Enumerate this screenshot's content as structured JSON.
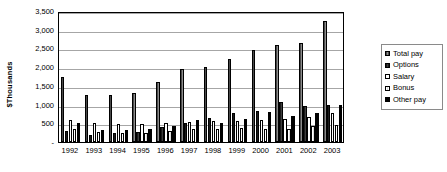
{
  "chart_data": {
    "type": "bar",
    "title": "",
    "xlabel": "",
    "ylabel": "$Thousands",
    "ylim": [
      0,
      3500
    ],
    "ytick_values": [
      0,
      500,
      1000,
      1500,
      2000,
      2500,
      3000,
      3500
    ],
    "ytick_labels": [
      "-",
      "500",
      "1,000",
      "1,500",
      "2,000",
      "2,500",
      "3,000",
      "3,500"
    ],
    "grid": true,
    "legend_position": "right",
    "categories": [
      "1992",
      "1993",
      "1994",
      "1995",
      "1996",
      "1997",
      "1998",
      "1999",
      "2000",
      "2001",
      "2002",
      "2003"
    ],
    "series": [
      {
        "name": "Total pay",
        "color": "#6e6e6e",
        "values": [
          1740,
          1260,
          1260,
          1320,
          1610,
          1950,
          2000,
          2220,
          2470,
          2590,
          2650,
          3220
        ]
      },
      {
        "name": "Options",
        "color": "#2b2b2b",
        "values": [
          290,
          190,
          240,
          260,
          390,
          520,
          650,
          780,
          830,
          1060,
          950,
          1000
        ]
      },
      {
        "name": "Salary",
        "color": "#ffffff",
        "values": [
          590,
          500,
          470,
          480,
          510,
          540,
          560,
          570,
          580,
          610,
          660,
          770
        ]
      },
      {
        "name": "Bonus",
        "color": "#eeeeee",
        "values": [
          340,
          260,
          240,
          250,
          300,
          360,
          360,
          370,
          360,
          340,
          420,
          460
        ]
      },
      {
        "name": "Other pay",
        "color": "#000000",
        "values": [
          510,
          320,
          310,
          340,
          440,
          600,
          520,
          620,
          800,
          690,
          780,
          990
        ]
      }
    ]
  }
}
